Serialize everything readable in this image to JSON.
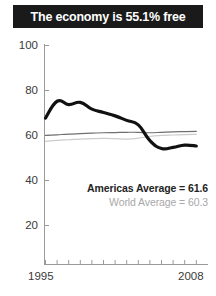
{
  "title": {
    "text": "The economy is 55.1% free",
    "background_color": "#1a1a1a",
    "text_color": "#ffffff"
  },
  "legend": {
    "americas": "Americas Average = 61.6",
    "world": "World Average = 60.3"
  },
  "axis": {
    "y_ticks": [
      "100",
      "80",
      "60",
      "40",
      "20"
    ],
    "x_start": "1995",
    "x_end": "2008"
  },
  "chart_data": {
    "type": "line",
    "title": "The economy is 55.1% free",
    "xlabel": "",
    "ylabel": "",
    "xlim": [
      1995,
      2008
    ],
    "ylim": [
      0,
      100
    ],
    "yticks": [
      20,
      40,
      60,
      80,
      100
    ],
    "xticks": [
      1995,
      1996,
      1997,
      1998,
      1999,
      2000,
      2001,
      2002,
      2003,
      2004,
      2005,
      2006,
      2007,
      2008
    ],
    "xtick_labels_shown": [
      "1995",
      "2008"
    ],
    "grid": false,
    "legend_position": "inside-lower-right",
    "x": [
      1995,
      1996,
      1997,
      1998,
      1999,
      2000,
      2001,
      2002,
      2003,
      2004,
      2005,
      2006,
      2007,
      2008
    ],
    "series": [
      {
        "name": "Country score",
        "color": "#111111",
        "width": 3.2,
        "values": [
          67.5,
          75.0,
          73.5,
          74.5,
          71.5,
          70.0,
          68.5,
          66.5,
          64.5,
          57.5,
          54.0,
          54.5,
          55.5,
          55.1
        ]
      },
      {
        "name": "Americas Average",
        "color": "#6f6f6f",
        "width": 1.2,
        "values": [
          59.8,
          60.1,
          60.4,
          60.6,
          60.8,
          61.0,
          61.1,
          61.2,
          61.2,
          61.0,
          61.2,
          61.4,
          61.5,
          61.6
        ]
      },
      {
        "name": "World Average",
        "color": "#cccccc",
        "width": 1.2,
        "values": [
          57.2,
          57.6,
          57.9,
          58.2,
          58.4,
          58.5,
          58.4,
          58.2,
          58.6,
          59.4,
          59.8,
          60.0,
          60.2,
          60.3
        ]
      }
    ],
    "annotations": [
      {
        "text": "Americas Average = 61.6",
        "color": "#242424"
      },
      {
        "text": "World Average = 60.3",
        "color": "#a8a8a8"
      }
    ]
  }
}
